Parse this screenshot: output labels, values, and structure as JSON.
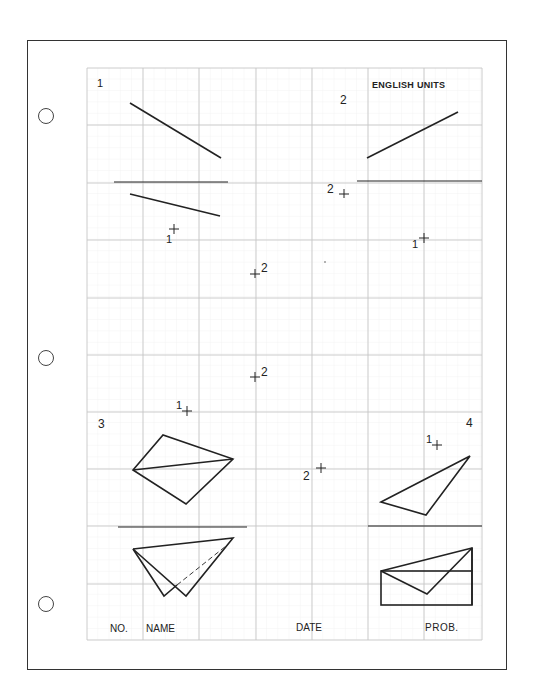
{
  "sheet": {
    "units_label": "ENGLISH UNITS",
    "footer": {
      "no_label": "NO.",
      "name_label": "NAME",
      "date_label": "DATE",
      "prob_label": "PROB."
    }
  },
  "problems": [
    {
      "number": "1"
    },
    {
      "number": "2"
    },
    {
      "number": "3"
    },
    {
      "number": "4"
    }
  ],
  "point_labels": {
    "p1_a": "1",
    "p2_a": "2",
    "p1_b": "1",
    "p2_b": "2",
    "p2_c": "2",
    "p1_c": "1",
    "p2_d": "2",
    "p1_d": "1"
  },
  "colors": {
    "ink": "#222222",
    "grid": "#c8c8c8",
    "grid_fine": "#e6e6e6",
    "border": "#333333"
  }
}
